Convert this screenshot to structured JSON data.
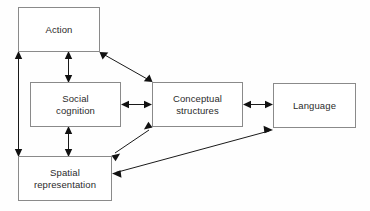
{
  "diagram": {
    "background_color": "#fefefe",
    "box_border_color": "#8a8a8a",
    "line_color": "#1a1a1a",
    "text_color": "#2b2b2b",
    "nodes": [
      {
        "id": "action",
        "label": "Action",
        "x": 18,
        "y": 7,
        "w": 82,
        "h": 45
      },
      {
        "id": "social-cognition",
        "label": "Social\ncognition",
        "x": 30,
        "y": 82,
        "w": 91,
        "h": 45
      },
      {
        "id": "conceptual-structures",
        "label": "Conceptual\nstructures",
        "x": 152,
        "y": 82,
        "w": 91,
        "h": 45
      },
      {
        "id": "language",
        "label": "Language",
        "x": 273,
        "y": 83,
        "w": 83,
        "h": 45
      },
      {
        "id": "spatial-representation",
        "label": "Spatial\nrepresentation",
        "x": 18,
        "y": 156,
        "w": 94,
        "h": 45
      }
    ],
    "edges": [
      {
        "id": "action-spatial",
        "from": "action",
        "to": "spatial-representation",
        "style": "double-headed",
        "orientation": "vertical-left"
      },
      {
        "id": "action-social",
        "from": "action",
        "to": "social-cognition",
        "style": "double-headed",
        "orientation": "vertical-middle"
      },
      {
        "id": "social-spatial",
        "from": "social-cognition",
        "to": "spatial-representation",
        "style": "double-headed",
        "orientation": "vertical-middle"
      },
      {
        "id": "social-conceptual",
        "from": "social-cognition",
        "to": "conceptual-structures",
        "style": "double-headed",
        "orientation": "horizontal"
      },
      {
        "id": "conceptual-language",
        "from": "conceptual-structures",
        "to": "language",
        "style": "double-headed",
        "orientation": "horizontal"
      },
      {
        "id": "action-conceptual",
        "from": "action",
        "to": "conceptual-structures",
        "style": "double-headed",
        "orientation": "diagonal"
      },
      {
        "id": "spatial-conceptual",
        "from": "spatial-representation",
        "to": "conceptual-structures",
        "style": "double-headed",
        "orientation": "diagonal"
      },
      {
        "id": "spatial-language",
        "from": "spatial-representation",
        "to": "language",
        "style": "double-headed",
        "orientation": "diagonal-long"
      }
    ]
  }
}
